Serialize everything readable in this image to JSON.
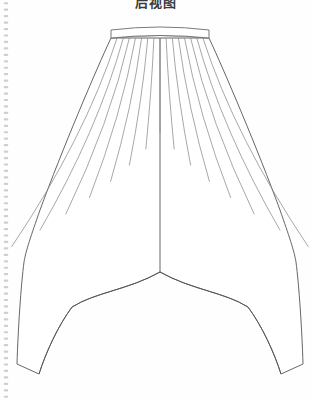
{
  "page": {
    "width": 311,
    "height": 400,
    "background_color": "#ffffff",
    "medium": "spiral-bound sketchbook page"
  },
  "title": {
    "text": "后视图",
    "translation_hint": "back view",
    "color": "#3a3a3a",
    "clipped_at_top": true
  },
  "binding": {
    "name": "spiral-binding-perforation",
    "edge": "left",
    "dot_color": "#cfcfcf",
    "dot_count": 62,
    "x": 6
  },
  "drawing": {
    "name": "harem-trousers-technical-flat",
    "garment": "drop-crotch harem trousers",
    "view": "back",
    "stroke_color": "#555555",
    "waistband_stroke_color": "#6b6b6b",
    "gather_stroke_color": "#8a8a8a",
    "fill_color": "#ffffff",
    "stroke_width": 0.9,
    "waistband": {
      "name": "waistband",
      "left_x": 111,
      "right_x": 209,
      "top_y": 27,
      "bottom_y": 38,
      "curve_rise": 5
    },
    "center_back_seam": {
      "name": "center-back-seam",
      "x": 160,
      "top_y": 38,
      "bottom_y": 272
    },
    "crotch": {
      "name": "crotch-point",
      "x": 160,
      "y": 272
    },
    "gather_lines": {
      "count": 15,
      "origin_y": 38,
      "description": "radiating pleat / gather lines from waistband"
    },
    "left_leg": {
      "name": "left-leg",
      "hip_max_x": 28,
      "hip_y": 255,
      "hem_outer": [
        17,
        364
      ],
      "hem_inner": [
        39,
        374
      ]
    },
    "right_leg": {
      "name": "right-leg",
      "hip_max_x": 292,
      "hip_y": 255,
      "hem_outer": [
        296,
        364
      ],
      "hem_inner": [
        274,
        374
      ]
    }
  }
}
